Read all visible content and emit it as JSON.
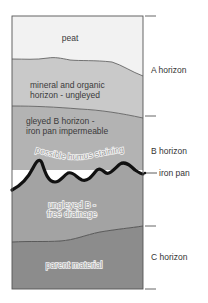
{
  "diagram": {
    "colors": {
      "peat": "#f2f2f2",
      "mineral_organic": "#c9c9c9",
      "gleyed_b": "#b3b3b3",
      "ungleyed_b": "#a3a3a3",
      "parent_material": "#8c8c8c",
      "iron_pan": "#111111",
      "outline": "#555555"
    },
    "layers": [
      {
        "name": "peat",
        "label": "peat"
      },
      {
        "name": "mineral-organic",
        "line1": "mineral and organic",
        "line2": "horizon - ungleyed"
      },
      {
        "name": "gleyed-b",
        "line1": "gleyed B horizon -",
        "line2": "iron pan impermeable"
      },
      {
        "name": "humus",
        "label": "possible humus staining"
      },
      {
        "name": "ungleyed-b",
        "line1": "ungleyed B -",
        "line2": "free drainage"
      },
      {
        "name": "parent-material",
        "label": "parent material"
      }
    ],
    "horizons": [
      {
        "label": "A horizon"
      },
      {
        "label": "B horizon"
      },
      {
        "label": "C horizon"
      }
    ],
    "callout": {
      "label": "iron pan"
    }
  }
}
